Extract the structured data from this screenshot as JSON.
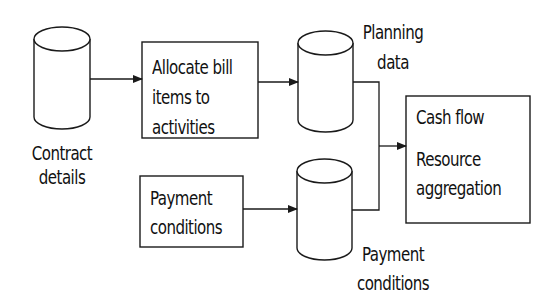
{
  "diagram": {
    "nodes": [
      {
        "id": "contract_details",
        "shape": "cylinder",
        "label_lines": [
          "Contract",
          "details"
        ]
      },
      {
        "id": "allocate",
        "shape": "box",
        "label_lines": [
          "Allocate bill",
          "items to",
          "activities"
        ]
      },
      {
        "id": "planning_data",
        "shape": "cylinder",
        "label_lines": [
          "Planning",
          "data"
        ]
      },
      {
        "id": "payment_conditions_proc",
        "shape": "box",
        "label_lines": [
          "Payment",
          "conditions"
        ]
      },
      {
        "id": "payment_conditions_store",
        "shape": "cylinder",
        "label_lines": [
          "Payment",
          "conditions"
        ]
      },
      {
        "id": "output",
        "shape": "box",
        "label_lines": [
          "Cash flow",
          "Resource",
          "aggregation"
        ]
      }
    ],
    "edges": [
      {
        "from": "contract_details",
        "to": "allocate"
      },
      {
        "from": "allocate",
        "to": "planning_data"
      },
      {
        "from": "planning_data",
        "to": "output"
      },
      {
        "from": "payment_conditions_proc",
        "to": "payment_conditions_store"
      },
      {
        "from": "payment_conditions_store",
        "to": "output"
      }
    ],
    "stroke_color": "#1a1a1a"
  }
}
